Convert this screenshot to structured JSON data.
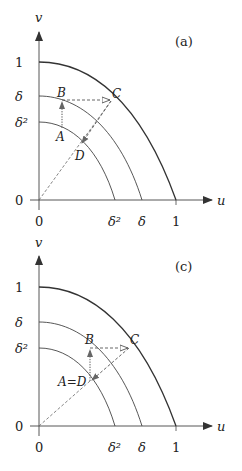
{
  "panels": [
    {
      "label": "(a)",
      "axis_x_label": "u",
      "axis_y_label": "v",
      "y_ticks": [
        "1",
        "δ",
        "δ²",
        "0"
      ],
      "x_ticks": [
        "0",
        "δ²",
        "δ",
        "1"
      ],
      "points": {
        "A": "A",
        "B": "B",
        "C": "C",
        "D": "D"
      }
    },
    {
      "label": "(c)",
      "axis_x_label": "u",
      "axis_y_label": "v",
      "y_ticks": [
        "1",
        "δ",
        "δ²",
        "0"
      ],
      "x_ticks": [
        "0",
        "δ²",
        "δ",
        "1"
      ],
      "points": {
        "AD": "A=D",
        "B": "B",
        "C": "C"
      }
    }
  ],
  "colors": {
    "curve": "#333333",
    "axis": "#444444",
    "dashed": "#555555"
  }
}
